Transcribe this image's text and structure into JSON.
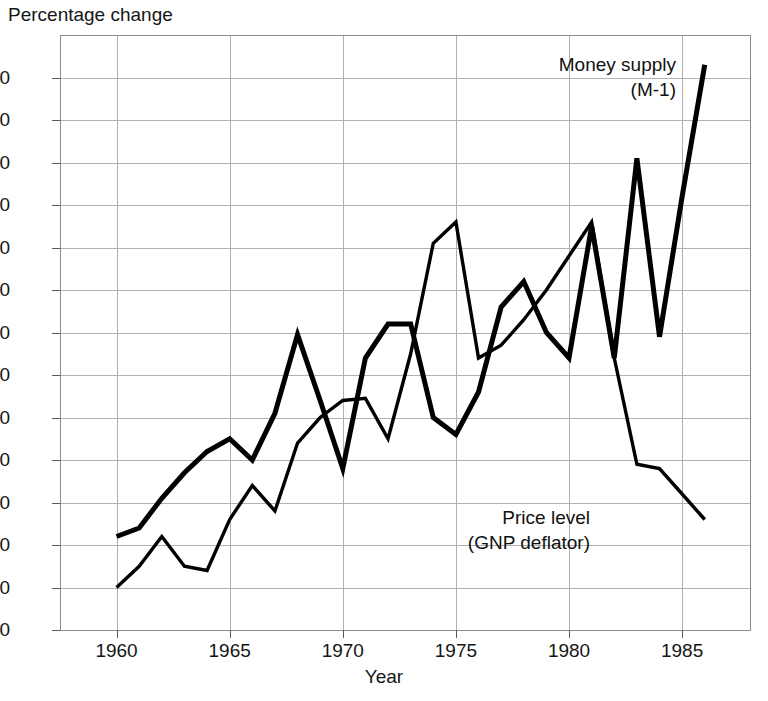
{
  "chart_data": {
    "type": "line",
    "title": "",
    "xlabel": "Year",
    "ylabel": "Percentage change",
    "x": [
      1960,
      1961,
      1962,
      1963,
      1964,
      1965,
      1966,
      1967,
      1968,
      1969,
      1970,
      1971,
      1972,
      1973,
      1974,
      1975,
      1976,
      1977,
      1978,
      1979,
      1980,
      1981,
      1982,
      1983,
      1984,
      1985,
      1986
    ],
    "xlim": [
      1957.5,
      1988.0
    ],
    "ylim": [
      0,
      14.0
    ],
    "xticks": [
      1960,
      1965,
      1970,
      1975,
      1980,
      1985
    ],
    "xticklabels": [
      "1960",
      "1965",
      "1970",
      "1975",
      "1980",
      "1985"
    ],
    "yticks": [
      0,
      1.0,
      2.0,
      3.0,
      4.0,
      5.0,
      6.0,
      7.0,
      8.0,
      9.0,
      10.0,
      11.0,
      12.0,
      13.0
    ],
    "yticklabels": [
      "0",
      "1.0",
      "2.0",
      "3.0",
      "4.0",
      "5.0",
      "6.0",
      "7.0",
      "8.0",
      "9.0",
      "10.0",
      "11.0",
      "12.0",
      "13.0"
    ],
    "grid": true,
    "legend_position": "inline-annotations",
    "series": [
      {
        "name": "Money supply (M-1)",
        "label_line1": "Money supply",
        "label_line2": "(M-1)",
        "color": "#000000",
        "line_width": 5.0,
        "values": [
          2.2,
          2.4,
          3.1,
          3.7,
          4.2,
          4.5,
          4.0,
          5.1,
          6.95,
          5.4,
          3.8,
          6.4,
          7.2,
          7.2,
          5.0,
          4.6,
          5.6,
          7.6,
          8.2,
          7.0,
          6.4,
          9.5,
          6.4,
          11.1,
          6.9,
          10.2,
          13.3
        ]
      },
      {
        "name": "Price level (GNP deflator)",
        "label_line1": "Price level",
        "label_line2": "(GNP deflator)",
        "color": "#000000",
        "line_width": 3.4,
        "values": [
          1.0,
          1.5,
          2.2,
          1.5,
          1.4,
          2.6,
          3.4,
          2.8,
          4.4,
          5.0,
          5.4,
          5.45,
          4.5,
          6.5,
          9.1,
          9.6,
          6.4,
          6.7,
          7.3,
          8.0,
          8.8,
          9.6,
          6.4,
          3.9,
          3.8,
          3.2,
          2.6
        ]
      }
    ]
  },
  "layout": {
    "plot_left": 60,
    "plot_right": 750,
    "plot_top": 35,
    "plot_bottom": 630,
    "width": 768,
    "height": 701
  }
}
